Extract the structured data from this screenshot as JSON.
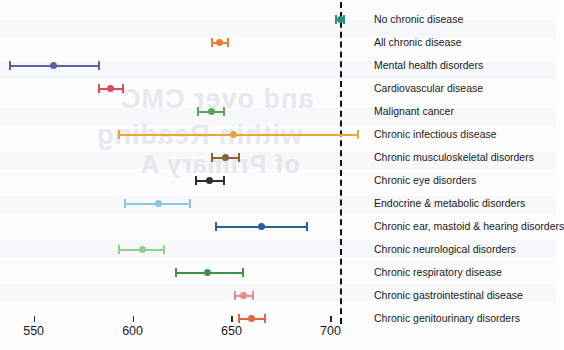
{
  "chart_data": {
    "type": "scatter",
    "subtype": "forest-plot-error-bars",
    "title": "",
    "xlabel": "",
    "ylabel": "",
    "xlim": [
      533,
      720
    ],
    "xticks": [
      550,
      600,
      650,
      700
    ],
    "xtick_labels": [
      "550",
      "600",
      "650",
      "700"
    ],
    "grid": false,
    "legend": null,
    "reference_line": {
      "value": 705,
      "style": "dashed",
      "color": "#111111"
    },
    "categories": [
      "No chronic disease",
      "All chronic disease",
      "Mental health disorders",
      "Cardiovascular disease",
      "Malignant cancer",
      "Chronic infectious disease",
      "Chronic musculoskeletal disorders",
      "Chronic eye disorders",
      "Endocrine & metabolic disorders",
      "Chronic ear, mastoid & hearing disorders",
      "Chronic neurological disorders",
      "Chronic respiratory disease",
      "Chronic gastrointestinal disease",
      "Chronic genitourinary disorders"
    ],
    "points": [
      {
        "label": "No chronic disease",
        "estimate": 705,
        "low": 703,
        "high": 707,
        "color": "#2f8f7f"
      },
      {
        "label": "All chronic disease",
        "estimate": 644,
        "low": 640,
        "high": 648,
        "color": "#ef7d3a"
      },
      {
        "label": "Mental health disorders",
        "estimate": 560,
        "low": 538,
        "high": 583,
        "color": "#5f5fa8"
      },
      {
        "label": "Cardiovascular disease",
        "estimate": 589,
        "low": 583,
        "high": 595,
        "color": "#e0475f"
      },
      {
        "label": "Malignant cancer",
        "estimate": 640,
        "low": 633,
        "high": 646,
        "color": "#57a85a"
      },
      {
        "label": "Chronic infectious disease",
        "estimate": 651,
        "low": 593,
        "high": 714,
        "color": "#e8a73c"
      },
      {
        "label": "Chronic musculoskeletal disorders",
        "estimate": 647,
        "low": 640,
        "high": 654,
        "color": "#8c6239"
      },
      {
        "label": "Chronic eye disorders",
        "estimate": 639,
        "low": 632,
        "high": 646,
        "color": "#2e2e2e"
      },
      {
        "label": "Endocrine & metabolic disorders",
        "estimate": 613,
        "low": 596,
        "high": 629,
        "color": "#8ec4e8"
      },
      {
        "label": "Chronic ear, mastoid & hearing disorders",
        "estimate": 665,
        "low": 642,
        "high": 688,
        "color": "#2b5f99"
      },
      {
        "label": "Chronic neurological disorders",
        "estimate": 605,
        "low": 593,
        "high": 616,
        "color": "#8fd08a"
      },
      {
        "label": "Chronic respiratory disease",
        "estimate": 638,
        "low": 622,
        "high": 656,
        "color": "#3f9243"
      },
      {
        "label": "Chronic gastrointestinal disease",
        "estimate": 656,
        "low": 652,
        "high": 661,
        "color": "#ef8a8a"
      },
      {
        "label": "Chronic genitourinary disorders",
        "estimate": 660,
        "low": 654,
        "high": 667,
        "color": "#e8624a"
      }
    ]
  },
  "axis": {
    "ticks": [
      {
        "value": 550,
        "label": "550"
      },
      {
        "value": 600,
        "label": "600"
      },
      {
        "value": 650,
        "label": "650"
      },
      {
        "value": 700,
        "label": "700"
      }
    ]
  },
  "watermark": {
    "line1": "and over CMC",
    "line2": "within Reading",
    "line3": "of Primary A"
  }
}
